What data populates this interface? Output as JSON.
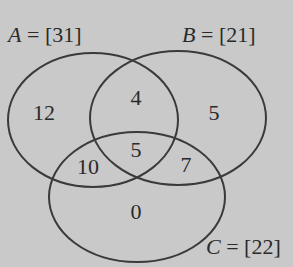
{
  "diagram": {
    "type": "venn",
    "sets": [
      {
        "name": "A",
        "label": "A",
        "eq": " = ",
        "total": "[31]"
      },
      {
        "name": "B",
        "label": "B",
        "eq": " = ",
        "total": "[21]"
      },
      {
        "name": "C",
        "label": "C",
        "eq": " = ",
        "total": "[22]"
      }
    ],
    "regions": {
      "a_only": "12",
      "a_and_b_only": "4",
      "b_only": "5",
      "a_and_c_only": "10",
      "a_b_c": "5",
      "b_and_c_only": "7",
      "c_only": "0"
    },
    "colors": {
      "background": "#c9c9c9",
      "stroke": "#3a3a3a",
      "text": "#2a2a2a"
    }
  }
}
